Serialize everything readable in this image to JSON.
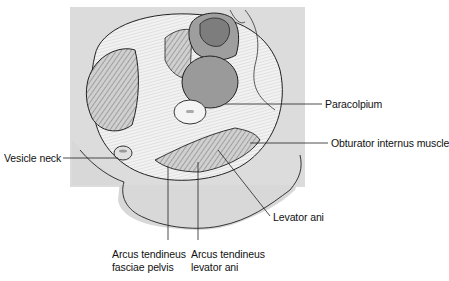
{
  "figure": {
    "type": "anatomical illustration",
    "colors": {
      "frame_bg": "#dcdcdc",
      "fascia": "#f2f2f2",
      "muscle": "#c9c9c9",
      "organ": "#9e9e9e",
      "organ_dark": "#8a8a8a",
      "outline": "#222222",
      "leader_line": "#222222"
    }
  },
  "labels": {
    "paracolpium": "Paracolpium",
    "obturator_internus": "Obturator internus muscle",
    "vesicle_neck": "Vesicle neck",
    "levator_ani": "Levator ani",
    "arcus_fasciae_pelvis_line1": "Arcus tendineus",
    "arcus_fasciae_pelvis_line2": "fasciae pelvis",
    "arcus_levator_ani_line1": "Arcus tendineus",
    "arcus_levator_ani_line2": "levator ani"
  }
}
